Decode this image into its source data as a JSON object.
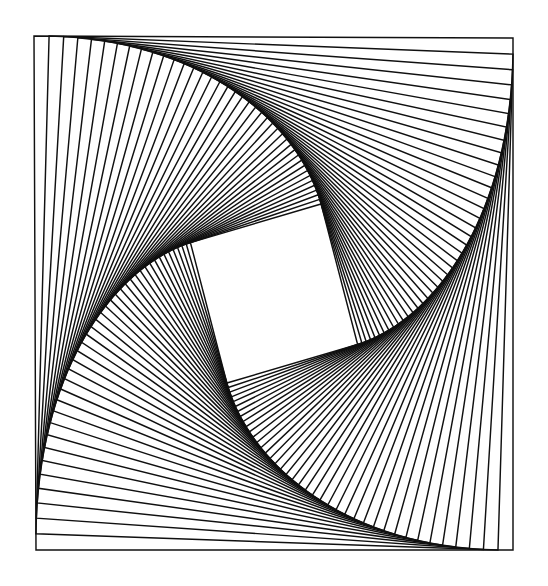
{
  "figure": {
    "type": "geometric-line-figure",
    "canvas": {
      "width": 548,
      "height": 586,
      "background_color": "#ffffff"
    },
    "stroke": {
      "color": "#101010",
      "width": 1.45,
      "linejoin": "miter"
    }
  },
  "chart_data": {
    "type": "line",
    "subtitle": "",
    "xlabel": "",
    "ylabel": "",
    "grid": false,
    "legend_position": "none",
    "construction": {
      "scheme": "iterated-inscribed-quadrilateral",
      "rotation_direction": "clockwise",
      "step_fraction_t": 0.0315,
      "iterations": 41,
      "scale_ratio_per_step": 0.9562,
      "total_rotation_degrees": 74.0,
      "envelope_count": 4
    },
    "outer_square": {
      "top_left": [
        34,
        36
      ],
      "top_right": [
        513,
        38
      ],
      "bottom_right": [
        513,
        550
      ],
      "bottom_left": [
        36,
        550
      ],
      "width": 479,
      "height": 514
    },
    "inner_square": {
      "top_left": [
        227,
        237
      ],
      "top_right": [
        322,
        238
      ],
      "bottom_right": [
        322,
        343
      ],
      "bottom_left": [
        228,
        343
      ],
      "width": 95,
      "height": 106
    },
    "annotations": []
  }
}
